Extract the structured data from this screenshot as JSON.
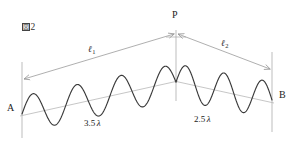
{
  "figure": {
    "caption_prefix": "図",
    "caption_number": "2",
    "caption_full": "図2"
  },
  "points": {
    "apex": "P",
    "left_source": "A",
    "right_source": "B"
  },
  "paths": {
    "left": {
      "symbol": "ℓ",
      "subscript": "1",
      "label": "ℓ1"
    },
    "right": {
      "symbol": "ℓ",
      "subscript": "2",
      "label": "ℓ2"
    }
  },
  "wavelengths": {
    "left_value": "3.5",
    "left_unit": "λ",
    "left_label": "3.5 λ",
    "right_value": "2.5",
    "right_unit": "λ",
    "right_label": "2.5 λ"
  },
  "colors": {
    "wave_stroke": "#3a3a3a",
    "guide_stroke": "#b0b0b0",
    "arrow_stroke": "#9a9a9a",
    "axis_stroke": "#b5b5b5",
    "background": "#ffffff",
    "text": "#1c1c1c"
  },
  "chart_data": {
    "type": "line",
    "title": "図2",
    "xlabel": "",
    "ylabel": "",
    "grid": false,
    "legend": null,
    "annotations": [
      {
        "text": "P",
        "role": "apex-point",
        "x": 176,
        "y": 18
      },
      {
        "text": "A",
        "role": "left-source",
        "x": 10,
        "y": 108
      },
      {
        "text": "B",
        "role": "right-source",
        "x": 277,
        "y": 96
      },
      {
        "text": "ℓ1",
        "role": "left-path-length",
        "x": 92,
        "y": 50
      },
      {
        "text": "ℓ2",
        "role": "right-path-length",
        "x": 224,
        "y": 44
      },
      {
        "text": "3.5 λ",
        "role": "left-wave-count",
        "x": 88,
        "y": 124
      },
      {
        "text": "2.5 λ",
        "role": "right-wave-count",
        "x": 196,
        "y": 120
      }
    ],
    "series": [
      {
        "name": "wave-from-A-to-P",
        "cycles": 3.5,
        "baseline": [
          [
            22,
            114
          ],
          [
            176,
            82
          ]
        ],
        "amplitude": 18,
        "phase_deg": 180
      },
      {
        "name": "wave-from-P-to-B",
        "cycles": 2.5,
        "baseline": [
          [
            176,
            82
          ],
          [
            272,
            100
          ]
        ],
        "amplitude": 18,
        "phase_deg": 180
      }
    ],
    "guides": [
      {
        "name": "left-baseline",
        "from": [
          22,
          114
        ],
        "to": [
          176,
          82
        ]
      },
      {
        "name": "right-baseline",
        "from": [
          176,
          82
        ],
        "to": [
          272,
          100
        ]
      },
      {
        "name": "apex-vertical",
        "from": [
          176,
          30
        ],
        "to": [
          176,
          100
        ]
      },
      {
        "name": "left-source-vertical",
        "from": [
          22,
          62
        ],
        "to": [
          22,
          138
        ]
      },
      {
        "name": "right-source-vertical",
        "from": [
          272,
          52
        ],
        "to": [
          272,
          132
        ]
      }
    ],
    "dimension_arrows": [
      {
        "name": "left-path-arrow",
        "from": [
          24,
          79
        ],
        "to": [
          174,
          34
        ],
        "double_headed": true
      },
      {
        "name": "right-path-arrow",
        "from": [
          178,
          34
        ],
        "to": [
          270,
          69
        ],
        "double_headed": true
      }
    ]
  }
}
